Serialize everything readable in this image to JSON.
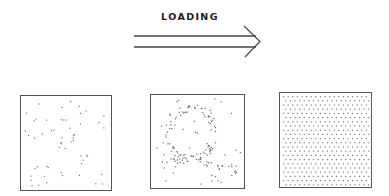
{
  "title": "LOADING",
  "arrow": {
    "line_top": {
      "x1": 134,
      "y1": 36,
      "x2": 256,
      "y2": 36
    },
    "line_bottom": {
      "x1": 134,
      "y1": 47,
      "x2": 256,
      "y2": 47
    },
    "head": [
      [
        244,
        26
      ],
      [
        260,
        41.5
      ],
      [
        245,
        57
      ]
    ],
    "color": "#444444"
  },
  "panels": [
    {
      "name": "sparse",
      "box": {
        "x": 20,
        "y": 95,
        "w": 92,
        "h": 96
      },
      "mode": "random",
      "count": 55,
      "seed": 7,
      "dot_color": "#777777"
    },
    {
      "name": "partial-pattern",
      "box": {
        "x": 150,
        "y": 94,
        "w": 95,
        "h": 95
      },
      "mode": "loop",
      "count": 160,
      "seed": 13,
      "dot_color": "#6a6a6a"
    },
    {
      "name": "dense",
      "box": {
        "x": 279,
        "y": 92,
        "w": 93,
        "h": 96
      },
      "mode": "grid",
      "spacing_x": 4.6,
      "spacing_y": 4.2,
      "dot_color": "#7a7a7a"
    }
  ]
}
